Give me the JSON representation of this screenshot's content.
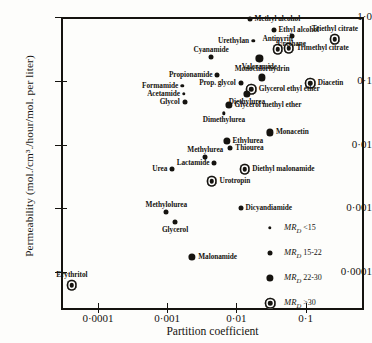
{
  "chart_data": {
    "type": "scatter",
    "title": "",
    "xlabel": "Partition coefficient",
    "ylabel": "Permeability (mol./cm³./hour/mol. per liter)",
    "xscale": "log",
    "yscale": "log",
    "xlim": [
      2e-05,
      0.5
    ],
    "ylim": [
      5e-05,
      1.0
    ],
    "xticks": [
      "0·0001",
      "0·001",
      "0·01",
      "0·1"
    ],
    "xtick_values": [
      0.0001,
      0.001,
      0.01,
      0.1
    ],
    "yticks": [
      "1·0",
      "0·1",
      "0·01",
      "0·001",
      "0·0001"
    ],
    "ytick_values": [
      1.0,
      0.1,
      0.01,
      0.001,
      0.0001
    ],
    "grid": false,
    "legend_position": "lower-right",
    "size_encoding": "marker size encodes MR_D (molar refraction) class",
    "legend": [
      {
        "label": "MR",
        "sub": "D",
        "range": "<15",
        "size": "s1"
      },
      {
        "label": "MR",
        "sub": "D",
        "range": "15-22",
        "size": "s2"
      },
      {
        "label": "MR",
        "sub": "D",
        "range": "22-30",
        "size": "s3"
      },
      {
        "label": "MR",
        "sub": "D",
        "range": ">30",
        "size": "s4"
      }
    ],
    "points": [
      {
        "name": "Methyl alcohol",
        "x": 0.0155,
        "y": 0.93,
        "size": "s2",
        "label_pos": "r"
      },
      {
        "name": "Ethyl alcohol",
        "x": 0.0345,
        "y": 0.62,
        "size": "s2",
        "label_pos": "r"
      },
      {
        "name": "Triethyl citrate",
        "x": 0.265,
        "y": 0.45,
        "size": "s4",
        "label_pos": "above"
      },
      {
        "name": "Urethane",
        "x": 0.063,
        "y": 0.5,
        "size": "s2",
        "label_pos": "below"
      },
      {
        "name": "Urethylan",
        "x": 0.0175,
        "y": 0.42,
        "size": "s1",
        "label_pos": "l"
      },
      {
        "name": "Antipyrin",
        "x": 0.0395,
        "y": 0.315,
        "size": "s4",
        "label_pos": "above"
      },
      {
        "name": "Trimethyl citrate",
        "x": 0.057,
        "y": 0.325,
        "size": "s4",
        "label_pos": "r"
      },
      {
        "name": "Cyanamide",
        "x": 0.0043,
        "y": 0.235,
        "size": "s2",
        "label_pos": "above"
      },
      {
        "name": "Valeramide",
        "x": 0.0215,
        "y": 0.225,
        "size": "s3",
        "label_pos": "below"
      },
      {
        "name": "Propionamide",
        "x": 0.0053,
        "y": 0.125,
        "size": "s2",
        "label_pos": "l"
      },
      {
        "name": "Monochlorhydrin",
        "x": 0.0235,
        "y": 0.113,
        "size": "s3",
        "label_pos": "above"
      },
      {
        "name": "Diacetin",
        "x": 0.116,
        "y": 0.092,
        "size": "s4",
        "label_pos": "r"
      },
      {
        "name": "Prop. glycol",
        "x": 0.0115,
        "y": 0.094,
        "size": "s2",
        "label_pos": "l"
      },
      {
        "name": "Formamide",
        "x": 0.00165,
        "y": 0.084,
        "size": "s1",
        "label_pos": "l"
      },
      {
        "name": "Glycerol ethyl ether",
        "x": 0.0163,
        "y": 0.074,
        "size": "s4",
        "label_pos": "r"
      },
      {
        "name": "Diethylurea",
        "x": 0.0142,
        "y": 0.063,
        "size": "s3",
        "label_pos": "below"
      },
      {
        "name": "Acetamide",
        "x": 0.00175,
        "y": 0.062,
        "size": "s1",
        "label_pos": "l"
      },
      {
        "name": "Glycol",
        "x": 0.00178,
        "y": 0.046,
        "size": "s2",
        "label_pos": "l"
      },
      {
        "name": "Glycerol methyl ether",
        "x": 0.0077,
        "y": 0.042,
        "size": "s3",
        "label_pos": "r"
      },
      {
        "name": "Dimethylurea",
        "x": 0.0066,
        "y": 0.031,
        "size": "s1",
        "label_pos": "below"
      },
      {
        "name": "Monacetin",
        "x": 0.0305,
        "y": 0.0155,
        "size": "s3",
        "label_pos": "r"
      },
      {
        "name": "Ethylurea",
        "x": 0.0072,
        "y": 0.0113,
        "size": "s3",
        "label_pos": "r"
      },
      {
        "name": "Thiourea",
        "x": 0.0082,
        "y": 0.0088,
        "size": "s2",
        "label_pos": "r"
      },
      {
        "name": "Methylurea",
        "x": 0.00355,
        "y": 0.0063,
        "size": "s2",
        "label_pos": "above"
      },
      {
        "name": "Lactamide",
        "x": 0.0048,
        "y": 0.0052,
        "size": "s2",
        "label_pos": "l"
      },
      {
        "name": "Diethyl malonamide",
        "x": 0.0131,
        "y": 0.0041,
        "size": "s4",
        "label_pos": "r"
      },
      {
        "name": "Urea",
        "x": 0.00118,
        "y": 0.0042,
        "size": "s2",
        "label_pos": "l"
      },
      {
        "name": "Urotropin",
        "x": 0.0044,
        "y": 0.00265,
        "size": "s4",
        "label_pos": "r"
      },
      {
        "name": "Dicyandiamide",
        "x": 0.0115,
        "y": 0.00103,
        "size": "s2",
        "label_pos": "r"
      },
      {
        "name": "Methylolurea",
        "x": 0.00097,
        "y": 0.00087,
        "size": "s2",
        "label_pos": "above"
      },
      {
        "name": "Glycerol",
        "x": 0.0013,
        "y": 0.00061,
        "size": "s2",
        "label_pos": "below"
      },
      {
        "name": "Malonamide",
        "x": 0.0023,
        "y": 0.000175,
        "size": "s3",
        "label_pos": "r"
      },
      {
        "name": "Erythritol",
        "x": 4.2e-05,
        "y": 6.2e-05,
        "size": "s4",
        "label_pos": "above"
      }
    ]
  }
}
